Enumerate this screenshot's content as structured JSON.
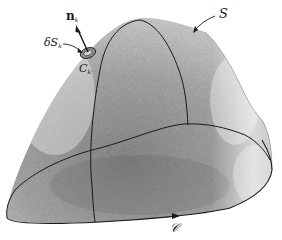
{
  "figure": {
    "labels": {
      "normal": {
        "main": "n",
        "sub": "k"
      },
      "element": {
        "main": "δS",
        "sub": "k"
      },
      "element_boundary": {
        "main": "C",
        "sub": "k"
      },
      "surface": "S",
      "boundary_curve": "𝒞"
    },
    "colors": {
      "ink": "#1a1a1a",
      "surface_dark": "#6b6b6b",
      "surface_light": "#e8e8e8",
      "background": "#ffffff"
    }
  }
}
